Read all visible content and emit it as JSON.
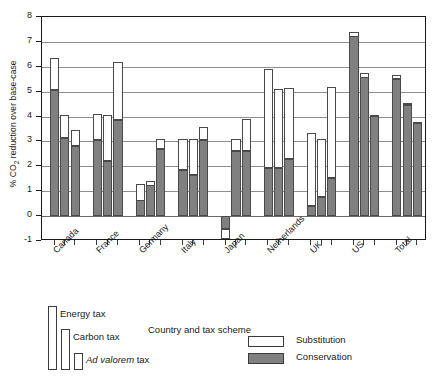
{
  "chart_data": {
    "type": "bar",
    "title": "",
    "xlabel": "Country and tax scheme",
    "ylabel_html": "% CO2 reduction over base-case",
    "ylabel_prefix": "% CO",
    "ylabel_sub": "2",
    "ylabel_suffix": " reduction over base-case",
    "ylim": [
      -1,
      8
    ],
    "yticks": [
      -1,
      0,
      1,
      2,
      3,
      4,
      5,
      6,
      7,
      8
    ],
    "grid": true,
    "legend_position": "below-axes",
    "categories": [
      "Canada",
      "France",
      "Germany",
      "Italy",
      "Japan",
      "Netherlands",
      "UK",
      "US",
      "Total"
    ],
    "sub_categories": [
      "Energy tax",
      "Carbon tax",
      "Ad valorem tax"
    ],
    "series": [
      {
        "name": "Conservation",
        "color": "#808080",
        "values": [
          [
            5.05,
            3.15,
            2.8
          ],
          [
            3.05,
            2.2,
            3.85
          ],
          [
            1.3,
            1.4,
            2.7
          ],
          [
            1.85,
            1.65,
            3.05
          ],
          [
            -0.5,
            2.6,
            2.6
          ],
          [
            1.95,
            1.95,
            2.3
          ],
          [
            0.4,
            0.75,
            1.55
          ],
          [
            7.4,
            5.75,
            4.05
          ],
          [
            5.5,
            4.45,
            3.75
          ]
        ]
      },
      {
        "name": "Substitution",
        "color": "#ffffff",
        "values": [
          [
            1.3,
            0.9,
            0.65
          ],
          [
            1.05,
            1.85,
            2.35
          ],
          [
            -0.7,
            -0.2,
            0.4
          ],
          [
            1.25,
            1.45,
            0.55
          ],
          [
            -0.4,
            0.5,
            1.3
          ],
          [
            3.95,
            3.15,
            2.85
          ],
          [
            2.95,
            2.35,
            3.65
          ],
          [
            -0.2,
            -0.2,
            0.0
          ],
          [
            0.15,
            0.1,
            0.05
          ]
        ]
      }
    ]
  },
  "legend": {
    "tax_schemes": [
      {
        "label": "Energy tax"
      },
      {
        "label": "Carbon tax"
      },
      {
        "label_italic": "Ad valorem",
        "label_rest": " tax"
      }
    ],
    "series": [
      {
        "label": "Substitution",
        "swatch": "white"
      },
      {
        "label": "Conservation",
        "swatch": "gray"
      }
    ]
  },
  "colors": {
    "conservation": "#808080",
    "substitution": "#ffffff",
    "axis": "#1a1a1a",
    "grid": "#8f8f8f"
  }
}
